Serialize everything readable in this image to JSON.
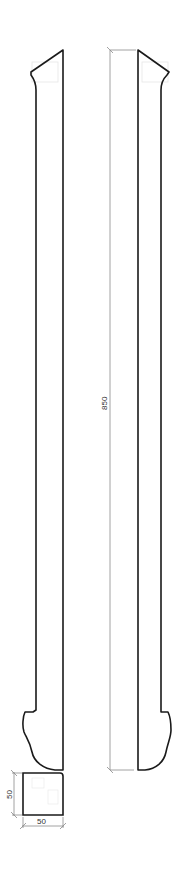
{
  "drawing": {
    "type": "technical-elevation",
    "subject": "baluster / post profile",
    "views": [
      {
        "name": "left-profile",
        "description": "side profile of post, left"
      },
      {
        "name": "right-profile",
        "description": "side profile of post, right (mirrored)"
      },
      {
        "name": "cross-section",
        "description": "square section"
      }
    ]
  },
  "dimensions": {
    "height": {
      "value": "850",
      "orientation": "vertical"
    },
    "section_height": {
      "value": "50",
      "orientation": "vertical"
    },
    "section_width": {
      "value": "50",
      "orientation": "horizontal"
    }
  },
  "colors": {
    "outline": "#1a1a1a",
    "dimension_line": "#8a8a8a",
    "background": "#ffffff"
  }
}
